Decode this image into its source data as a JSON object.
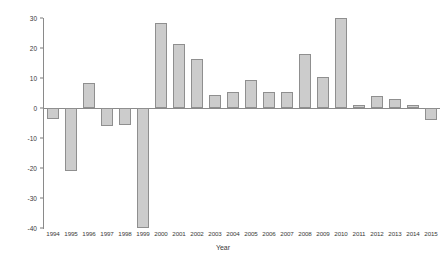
{
  "chart_data": {
    "type": "bar",
    "title": "",
    "subtitle": "",
    "xlabel": "Year",
    "ylabel": "Percentage change",
    "categories": [
      "1994",
      "1995",
      "1996",
      "1997",
      "1998",
      "1999",
      "2000",
      "2001",
      "2002",
      "2003",
      "2004",
      "2005",
      "2006",
      "2007",
      "2008",
      "2009",
      "2010",
      "2011",
      "2012",
      "2013",
      "2014",
      "2015"
    ],
    "values": [
      -3.5,
      -21,
      8.5,
      -6,
      -5.5,
      -40,
      28.5,
      21.5,
      16.5,
      4.5,
      5.5,
      9.5,
      5.5,
      5.5,
      18,
      10.5,
      30,
      1,
      4,
      3,
      1,
      -4
    ],
    "series": [
      {
        "name": "Percentage change",
        "values": [
          -3.5,
          -21,
          8.5,
          -6,
          -5.5,
          -40,
          28.5,
          21.5,
          16.5,
          4.5,
          5.5,
          9.5,
          5.5,
          5.5,
          18,
          10.5,
          30,
          1,
          4,
          3,
          1,
          -4
        ]
      }
    ],
    "ylim": [
      -40,
      30
    ],
    "yticks": [
      30,
      20,
      10,
      0,
      -10,
      -20,
      -30,
      -40
    ],
    "ytick_labels": [
      "30",
      "20",
      "10",
      "0",
      "-10",
      "-20",
      "-30",
      "-40"
    ],
    "grid": false,
    "legend": false,
    "legend_position": "none",
    "colors": {
      "bar_fill": "#cccccc",
      "bar_edge": "#8f8f8f",
      "axis": "#8a8a8a",
      "text": "#3a3a3a",
      "background": "#ffffff"
    }
  }
}
